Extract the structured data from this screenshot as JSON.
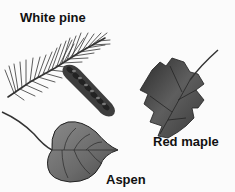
{
  "figure": {
    "labels": {
      "white_pine": "White pine",
      "red_maple": "Red maple",
      "aspen": "Aspen"
    },
    "items": [
      {
        "name": "White pine",
        "depiction": "pine-needle-branch-with-cone"
      },
      {
        "name": "Red maple",
        "depiction": "maple-leaf"
      },
      {
        "name": "Aspen",
        "depiction": "aspen-leaf"
      }
    ],
    "colors": {
      "background": "#fbfbfb",
      "leaf_dark": "#3a3a3a",
      "leaf_mid": "#6a6a6a",
      "text": "#111111"
    }
  }
}
